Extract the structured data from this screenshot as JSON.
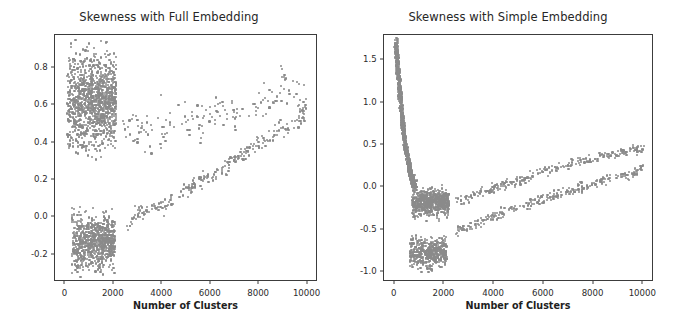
{
  "figure": {
    "width": 677,
    "height": 327,
    "background": "#ffffff",
    "point_color": "#8a8a8a",
    "axis_color": "#3c3c3c"
  },
  "panels": [
    {
      "id": "full-embedding",
      "title": "Skewness with Full Embedding",
      "xlabel": "Number of Clusters",
      "ylabel": "",
      "xticks": [
        "0",
        "2000",
        "4000",
        "6000",
        "8000",
        "10000"
      ],
      "xtick_values": [
        0,
        2000,
        4000,
        6000,
        8000,
        10000
      ],
      "yticks": [
        "0.8",
        "0.6",
        "0.4",
        "0.2",
        "0.0",
        "-0.2"
      ],
      "ytick_values": [
        0.8,
        0.6,
        0.4,
        0.2,
        0.0,
        -0.2
      ],
      "xlim": [
        -430,
        10430
      ],
      "ylim": [
        -0.345,
        0.975
      ],
      "frame": {
        "left": 54,
        "top": 34,
        "width": 263,
        "height": 247
      }
    },
    {
      "id": "simple-embedding",
      "title": "Skewness with Simple Embedding",
      "xlabel": "Number of Clusters",
      "ylabel": "",
      "xticks": [
        "0",
        "2000",
        "4000",
        "6000",
        "8000",
        "10000"
      ],
      "xtick_values": [
        0,
        2000,
        4000,
        6000,
        8000,
        10000
      ],
      "yticks": [
        "1.5",
        "1.0",
        "0.5",
        "0.0",
        "-0.5",
        "-1.0"
      ],
      "ytick_values": [
        1.5,
        1.0,
        0.5,
        0.0,
        -0.5,
        -1.0
      ],
      "xlim": [
        -430,
        10430
      ],
      "ylim": [
        -1.12,
        1.8
      ],
      "frame": {
        "left": 44,
        "top": 34,
        "width": 270,
        "height": 247
      }
    }
  ],
  "chart_data": [
    {
      "type": "scatter",
      "title": "Skewness with Full Embedding",
      "xlabel": "Number of Clusters",
      "ylabel": "Skewness",
      "xlim": [
        -430,
        10430
      ],
      "ylim": [
        -0.345,
        0.975
      ],
      "grid": false,
      "legend": null,
      "marker_color": "#8a8a8a",
      "series": [
        {
          "name": "dense-upper-cluster",
          "description": "Dense blob of points for cluster counts below ~2100, skewness roughly 0.30 to 0.95, centred near 0.62",
          "x_range": [
            60,
            2100
          ],
          "y_range": [
            0.3,
            0.95
          ],
          "n_points": 1150
        },
        {
          "name": "dense-lower-cluster",
          "description": "Dense blob of points for cluster counts below ~2050, skewness roughly -0.32 to 0.06, centred near -0.14",
          "x_range": [
            260,
            2050
          ],
          "y_range": [
            -0.32,
            0.06
          ],
          "n_points": 760
        },
        {
          "name": "upper-sparse-branch",
          "description": "Sparse scattered band rising slowly from about 0.45 at 2400 clusters to about 0.70 at 10000 clusters",
          "x": [
            2400,
            3000,
            3600,
            4200,
            4800,
            5400,
            6000,
            6600,
            7200,
            7800,
            8400,
            9000,
            9600,
            10000
          ],
          "y": [
            0.46,
            0.48,
            0.45,
            0.48,
            0.5,
            0.51,
            0.55,
            0.56,
            0.56,
            0.62,
            0.63,
            0.68,
            0.66,
            0.6
          ],
          "n_points": 165
        },
        {
          "name": "lower-rising-branch",
          "description": "Tight rising arc from about -0.08 at 2400 clusters to about 0.56 at 10000 clusters",
          "x": [
            2400,
            3000,
            3600,
            4200,
            4800,
            5400,
            6000,
            6600,
            7200,
            7800,
            8400,
            9000,
            9600,
            10000
          ],
          "y": [
            -0.06,
            0.02,
            0.05,
            0.08,
            0.13,
            0.18,
            0.21,
            0.27,
            0.32,
            0.38,
            0.43,
            0.47,
            0.52,
            0.56
          ],
          "n_points": 235
        }
      ]
    },
    {
      "type": "scatter",
      "title": "Skewness with Simple Embedding",
      "xlabel": "Number of Clusters",
      "ylabel": "Skewness",
      "xlim": [
        -430,
        10430
      ],
      "ylim": [
        -1.12,
        1.8
      ],
      "grid": false,
      "legend": null,
      "marker_color": "#8a8a8a",
      "series": [
        {
          "name": "narrow-decay-spike",
          "description": "Very dense narrow vertical spike near the left edge decaying from about 1.72 at 60 clusters down to about 0.0 by 800 clusters",
          "x": [
            60,
            120,
            200,
            300,
            420,
            560,
            700,
            850
          ],
          "y": [
            1.72,
            1.45,
            1.15,
            0.82,
            0.52,
            0.28,
            0.1,
            0.0
          ],
          "n_points": 900
        },
        {
          "name": "upper-plateau-cluster",
          "description": "Dense blob between about 700 and 2200 clusters with skewness roughly -0.40 to 0.05, centred near -0.16",
          "x_range": [
            700,
            2200
          ],
          "y_range": [
            -0.4,
            0.05
          ],
          "n_points": 620
        },
        {
          "name": "lower-cluster",
          "description": "Dense blob between about 600 and 2100 clusters with skewness roughly -1.02 to -0.55, centred near -0.78",
          "x_range": [
            600,
            2100
          ],
          "y_range": [
            -1.02,
            -0.55
          ],
          "n_points": 470
        },
        {
          "name": "upper-rising-branch",
          "description": "Rising band from about -0.16 at 2500 clusters to about 0.46 at 10000 clusters",
          "x": [
            2500,
            3100,
            3700,
            4300,
            4900,
            5500,
            6100,
            6700,
            7300,
            7900,
            8500,
            9100,
            9700,
            10000
          ],
          "y": [
            -0.15,
            -0.1,
            -0.04,
            0.02,
            0.08,
            0.13,
            0.19,
            0.24,
            0.29,
            0.33,
            0.37,
            0.41,
            0.44,
            0.46
          ],
          "n_points": 250
        },
        {
          "name": "lower-rising-branch",
          "description": "Rising band from about -0.55 at 2400 clusters to about 0.22 at 10000 clusters",
          "x": [
            2400,
            3000,
            3600,
            4200,
            4800,
            5400,
            6000,
            6600,
            7200,
            7800,
            8400,
            9000,
            9600,
            10000
          ],
          "y": [
            -0.54,
            -0.46,
            -0.39,
            -0.32,
            -0.26,
            -0.2,
            -0.14,
            -0.08,
            -0.03,
            0.02,
            0.08,
            0.13,
            0.18,
            0.22
          ],
          "n_points": 260
        }
      ]
    }
  ]
}
